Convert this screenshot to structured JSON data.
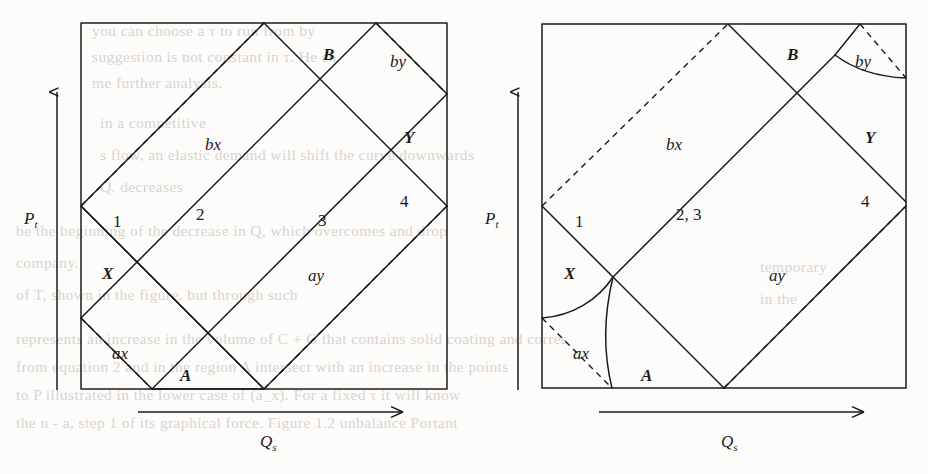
{
  "figure": {
    "kind": "two-panel-geometric-region-diagram",
    "background_color": "#fdfcfa",
    "ink_color": "#1b1b1b",
    "ghost_text_color": "#c9c6c0",
    "axes": {
      "y_label": "P",
      "y_sub": "t",
      "x_label": "Q",
      "x_sub": "s"
    },
    "panels": [
      {
        "id": "left",
        "name": "left-panel",
        "box": {
          "x": 81,
          "y": 23,
          "width": 366,
          "height": 366
        },
        "description": "all boundaries straight; regions 1,2,3,4 separate",
        "region_labels": [
          {
            "key": "one",
            "text": "1",
            "x": 113,
            "y": 213,
            "style": "num"
          },
          {
            "key": "two",
            "text": "2",
            "x": 196,
            "y": 206,
            "style": "num"
          },
          {
            "key": "three",
            "text": "3",
            "x": 318,
            "y": 212,
            "style": "num"
          },
          {
            "key": "four",
            "text": "4",
            "x": 400,
            "y": 193,
            "style": "num"
          },
          {
            "key": "B",
            "text": "B",
            "x": 323,
            "y": 46,
            "style": "reg"
          },
          {
            "key": "Y",
            "text": "Y",
            "x": 404,
            "y": 129,
            "style": "reg"
          },
          {
            "key": "X",
            "text": "X",
            "x": 102,
            "y": 265,
            "style": "reg"
          },
          {
            "key": "A",
            "text": "A",
            "x": 180,
            "y": 367,
            "style": "reg"
          },
          {
            "key": "bx",
            "text": "bx",
            "x": 205,
            "y": 136,
            "style": "low"
          },
          {
            "key": "by",
            "text": "by",
            "x": 390,
            "y": 53,
            "style": "low"
          },
          {
            "key": "ax",
            "text": "ax",
            "x": 112,
            "y": 345,
            "style": "low"
          },
          {
            "key": "ay",
            "text": "ay",
            "x": 308,
            "y": 267,
            "style": "low"
          }
        ],
        "y_axis_label_pos": {
          "x": 24,
          "y": 210
        },
        "x_axis_label_pos": {
          "x": 260,
          "y": 433
        }
      },
      {
        "id": "right",
        "name": "right-panel",
        "box": {
          "x": 542,
          "y": 24,
          "width": 364,
          "height": 364
        },
        "description": "regions 2 and 3 merged into one region labelled 2,3; the ax and by boundaries are curved",
        "region_labels": [
          {
            "key": "one",
            "text": "1",
            "x": 575,
            "y": 213,
            "style": "num"
          },
          {
            "key": "twothree",
            "text": "2, 3",
            "x": 676,
            "y": 206,
            "style": "num"
          },
          {
            "key": "four",
            "text": "4",
            "x": 861,
            "y": 193,
            "style": "num"
          },
          {
            "key": "B",
            "text": "B",
            "x": 787,
            "y": 46,
            "style": "reg"
          },
          {
            "key": "Y",
            "text": "Y",
            "x": 865,
            "y": 129,
            "style": "reg"
          },
          {
            "key": "X",
            "text": "X",
            "x": 564,
            "y": 265,
            "style": "reg"
          },
          {
            "key": "A",
            "text": "A",
            "x": 641,
            "y": 367,
            "style": "reg"
          },
          {
            "key": "bx",
            "text": "bx",
            "x": 666,
            "y": 136,
            "style": "low"
          },
          {
            "key": "by",
            "text": "by",
            "x": 855,
            "y": 53,
            "style": "low"
          },
          {
            "key": "ax",
            "text": "ax",
            "x": 573,
            "y": 345,
            "style": "low"
          },
          {
            "key": "ay",
            "text": "ay",
            "x": 769,
            "y": 267,
            "style": "low"
          }
        ],
        "y_axis_label_pos": {
          "x": 485,
          "y": 210
        },
        "x_axis_label_pos": {
          "x": 721,
          "y": 433
        }
      }
    ]
  },
  "ghost_text": [
    {
      "text": "you can choose a τ to run from by",
      "x": 92,
      "y": 22
    },
    {
      "text": "suggestion is not constant in τ. He sh",
      "x": 92,
      "y": 48
    },
    {
      "text": "me further analysis.",
      "x": 92,
      "y": 74
    },
    {
      "text": "in a competitive",
      "x": 100,
      "y": 114
    },
    {
      "text": "s flow, an elastic demand will shift the curve downwards",
      "x": 100,
      "y": 146
    },
    {
      "text": "Q. decreases",
      "x": 100,
      "y": 178
    },
    {
      "text": "be the beginning of the decrease in Q, which overcomes and drop",
      "x": 16,
      "y": 222
    },
    {
      "text": "company.",
      "x": 16,
      "y": 254
    },
    {
      "text": "of T, shown in the figure, but through such",
      "x": 16,
      "y": 286
    },
    {
      "text": "represents an increase in the volume of C + G that contains solid coating and corres",
      "x": 16,
      "y": 330
    },
    {
      "text": "from equation 2 and in the region A intersect with an increase in the points",
      "x": 16,
      "y": 358
    },
    {
      "text": "to P illustrated in the lower case of (a_x). For a fixed τ it will know",
      "x": 16,
      "y": 386
    },
    {
      "text": "the n - a, step 1 of its graphical force. Figure 1.2 unbalance Portant",
      "x": 16,
      "y": 414
    },
    {
      "text": "temporary",
      "x": 760,
      "y": 258
    },
    {
      "text": "in the",
      "x": 760,
      "y": 290
    }
  ]
}
